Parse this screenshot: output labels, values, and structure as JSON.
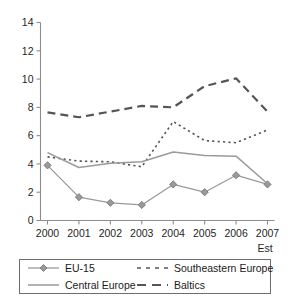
{
  "chart_data": {
    "type": "line",
    "title": "",
    "xlabel": "",
    "ylabel": "",
    "x": [
      "2000",
      "2001",
      "2002",
      "2003",
      "2004",
      "2005",
      "2006",
      "2007"
    ],
    "categories": [
      "2000",
      "2001",
      "2002",
      "2003",
      "2004",
      "2005",
      "2006",
      "2007"
    ],
    "last_point_note": "Est",
    "ylim": [
      0,
      14
    ],
    "yticks": [
      0,
      2,
      4,
      6,
      8,
      10,
      12,
      14
    ],
    "ytick_labels": [
      "0",
      "2",
      "4",
      "6",
      "8",
      "10",
      "12",
      "14"
    ],
    "grid": false,
    "legend_position": "bottom",
    "series": [
      {
        "name": "EU-15",
        "style": "solid-with-markers",
        "color": "#9a9a9a",
        "marker": "diamond",
        "values": [
          3.9,
          1.65,
          1.25,
          1.1,
          2.55,
          2.0,
          3.2,
          2.55
        ]
      },
      {
        "name": "Southeastern Europe",
        "style": "dotted",
        "color": "#555555",
        "marker": "none",
        "values": [
          4.5,
          4.2,
          4.15,
          3.8,
          7.0,
          5.65,
          5.5,
          6.4
        ]
      },
      {
        "name": "Central Europe",
        "style": "solid",
        "color": "#9a9a9a",
        "marker": "none",
        "values": [
          4.8,
          3.75,
          4.05,
          4.15,
          4.85,
          4.6,
          4.55,
          2.6
        ]
      },
      {
        "name": "Baltics",
        "style": "long-dashed",
        "color": "#555555",
        "marker": "none",
        "values": [
          7.65,
          7.3,
          7.7,
          8.1,
          8.0,
          9.5,
          10.05,
          7.7
        ]
      }
    ]
  },
  "legend": {
    "entries": [
      {
        "label": "EU-15"
      },
      {
        "label": "Southeastern Europe"
      },
      {
        "label": "Central Europe"
      },
      {
        "label": "Baltics"
      }
    ]
  },
  "axis": {
    "est_note": "Est"
  }
}
